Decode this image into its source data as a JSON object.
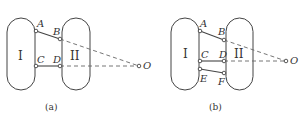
{
  "panels": [
    {
      "caption": "(a)",
      "link1_label": "I",
      "link2_label": "II",
      "points": {
        "A": "A",
        "B": "B",
        "C": "C",
        "D": "D",
        "O": "O"
      }
    },
    {
      "caption": "(b)",
      "link1_label": "I",
      "link2_label": "II",
      "points": {
        "A": "A",
        "B": "B",
        "C": "C",
        "D": "D",
        "E": "E",
        "F": "F",
        "O": "O"
      }
    }
  ]
}
